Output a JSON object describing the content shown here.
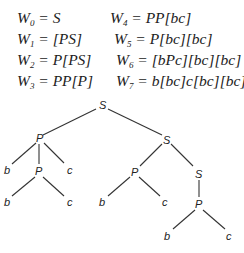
{
  "equations": [
    {
      "lhs": "W",
      "sub": "0",
      "rhs": "= S"
    },
    {
      "lhs": "W",
      "sub": "1",
      "rhs": "= [PS]"
    },
    {
      "lhs": "W",
      "sub": "2",
      "rhs": "= P[PS]"
    },
    {
      "lhs": "W",
      "sub": "3",
      "rhs": "= PP[P]"
    },
    {
      "lhs": "W",
      "sub": "4",
      "rhs": "= PP[bc]"
    },
    {
      "lhs": "W",
      "sub": "5",
      "rhs": "= P[bc][bc]"
    },
    {
      "lhs": "W",
      "sub": "6",
      "rhs": "= [bPc][bc][bc]"
    },
    {
      "lhs": "W",
      "sub": "7",
      "rhs": "= b[bc]c[bc][bc]"
    }
  ],
  "tree": {
    "nodes": {
      "root": "S",
      "p1": "P",
      "s2": "S",
      "b1": "b",
      "p2": "P",
      "c1": "c",
      "b2": "b",
      "c2": "c",
      "p3": "P",
      "s3": "S",
      "b3": "b",
      "c3": "c",
      "p4": "P",
      "b4": "b",
      "c4": "c"
    }
  }
}
